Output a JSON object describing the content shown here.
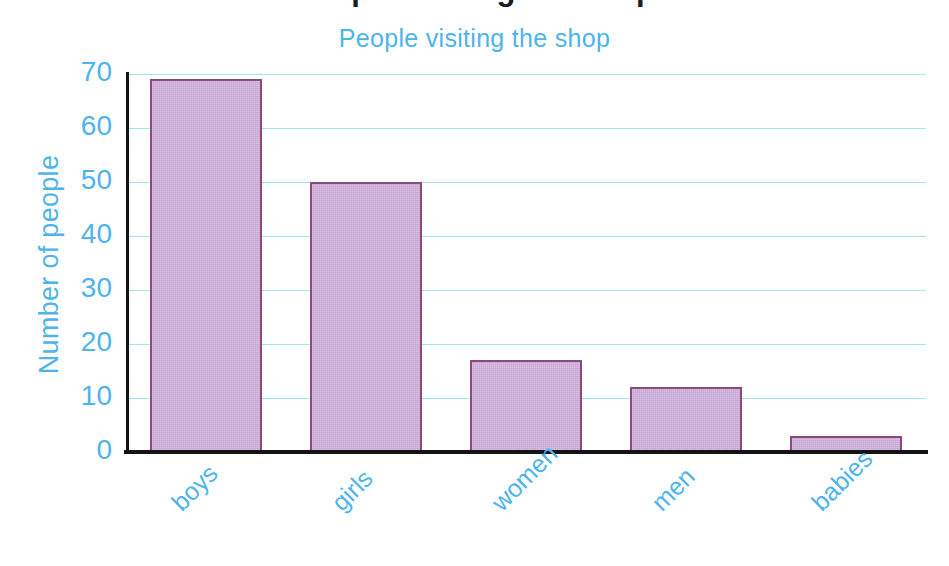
{
  "clipped_header": "People visiting the shop",
  "chart_data": {
    "type": "bar",
    "title": "People visiting the shop",
    "xlabel": "",
    "ylabel": "Number of people",
    "categories": [
      "boys",
      "girls",
      "women",
      "men",
      "babies"
    ],
    "values": [
      69,
      50,
      17,
      12,
      3
    ],
    "ylim": [
      0,
      70
    ],
    "y_ticks": [
      "0",
      "10",
      "20",
      "30",
      "40",
      "50",
      "60",
      "70"
    ],
    "y_tick_values": [
      0,
      10,
      20,
      30,
      40,
      50,
      60,
      70
    ],
    "grid": true,
    "legend": false,
    "colors": {
      "bar_fill": "#cfb0db",
      "bar_border": "#8c4a78",
      "text": "#4db4ec",
      "gridline": "#9fe7ef",
      "axis": "#141414",
      "background": "#ffffff"
    }
  }
}
